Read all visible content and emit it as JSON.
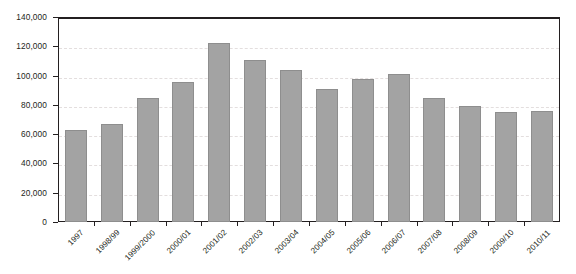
{
  "chart_data": {
    "type": "bar",
    "title": "",
    "subtitle": "",
    "xlabel": "",
    "ylabel": "",
    "categories": [
      "1997",
      "1998/99",
      "1999/2000",
      "2000/01",
      "2001/02",
      "2002/03",
      "2003/04",
      "2004/05",
      "2005/06",
      "2006/07",
      "2007/08",
      "2008/09",
      "2009/10",
      "2010/11"
    ],
    "values": [
      63000,
      67000,
      85000,
      95500,
      122000,
      110500,
      104000,
      91000,
      98000,
      101000,
      84500,
      79500,
      75000,
      75500
    ],
    "ylim": [
      0,
      140000
    ],
    "ytick_values": [
      0,
      20000,
      40000,
      60000,
      80000,
      100000,
      120000,
      140000
    ],
    "ytick_labels": [
      "0",
      "20,000",
      "40,000",
      "60,000",
      "80,000",
      "100,000",
      "120,000",
      "140,000"
    ],
    "grid": true,
    "legend": null,
    "legend_position": "none",
    "bar_color": "#a3a3a3",
    "bar_edge_color": "#8e8e8e",
    "gridline_color": "#e3dede",
    "axis_color": "#231f20",
    "background_color": "#ffffff",
    "xtick_label_rotation": -45
  }
}
